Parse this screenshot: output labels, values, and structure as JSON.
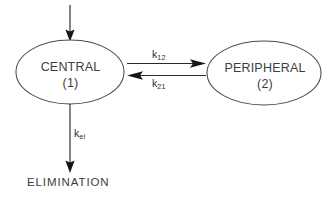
{
  "diagram": {
    "background_color": "#ffffff",
    "line_color": "#2b2b2b",
    "shape_stroke_color": "#4a4a4a",
    "text_color": "#3d3d3d",
    "compartments": [
      {
        "id": "central",
        "name": "CENTRAL",
        "number": "(1)",
        "shape": "ellipse",
        "cx": 70,
        "cy": 72,
        "rx": 54,
        "ry": 32
      },
      {
        "id": "peripheral",
        "name": "PERIPHERAL",
        "number": "(2)",
        "shape": "ellipse",
        "cx": 264,
        "cy": 73,
        "rx": 57,
        "ry": 32
      }
    ],
    "flows": [
      {
        "id": "input",
        "label": "",
        "from": "external",
        "to": "central",
        "direction": "down"
      },
      {
        "id": "k12",
        "label_base": "k",
        "label_sub": "12",
        "from": "central",
        "to": "peripheral",
        "direction": "right"
      },
      {
        "id": "k21",
        "label_base": "k",
        "label_sub": "21",
        "from": "peripheral",
        "to": "central",
        "direction": "left"
      },
      {
        "id": "kel",
        "label_base": "k",
        "label_sub": "el",
        "from": "central",
        "to": "elimination",
        "direction": "down"
      }
    ],
    "terminal": {
      "id": "elimination",
      "label": "ELIMINATION"
    }
  }
}
